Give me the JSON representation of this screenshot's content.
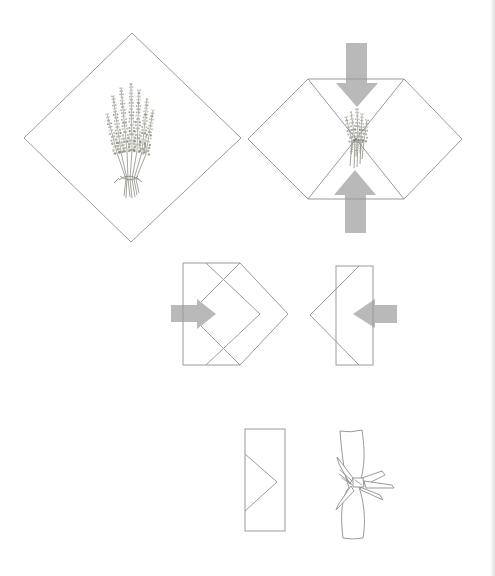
{
  "page": {
    "kind": "wrapping-instructions-illustration",
    "visible_text": ""
  },
  "colors": {
    "bg": "#ffffff",
    "outline": "#9a9a9a",
    "arrow": "#b9b9b9",
    "sketch": "#82827a",
    "grain": "#a3a296",
    "stem": "#8e8e85",
    "ribbon": "#8f8f8f"
  },
  "figures": [
    {
      "id": "step-1",
      "name": "open-cloth-diamond-with-lavender",
      "arrows": []
    },
    {
      "id": "step-2",
      "name": "fold-top-and-bottom-corners-to-center",
      "arrows": [
        "down",
        "up"
      ]
    },
    {
      "id": "step-3",
      "name": "fold-left-side-inward",
      "arrows": [
        "right"
      ]
    },
    {
      "id": "step-4",
      "name": "fold-right-side-inward",
      "arrows": [
        "left"
      ]
    },
    {
      "id": "step-5",
      "name": "flat-folded-packet",
      "arrows": []
    },
    {
      "id": "step-6",
      "name": "rolled-bundle-tied-with-ribbon-bow",
      "arrows": []
    }
  ]
}
